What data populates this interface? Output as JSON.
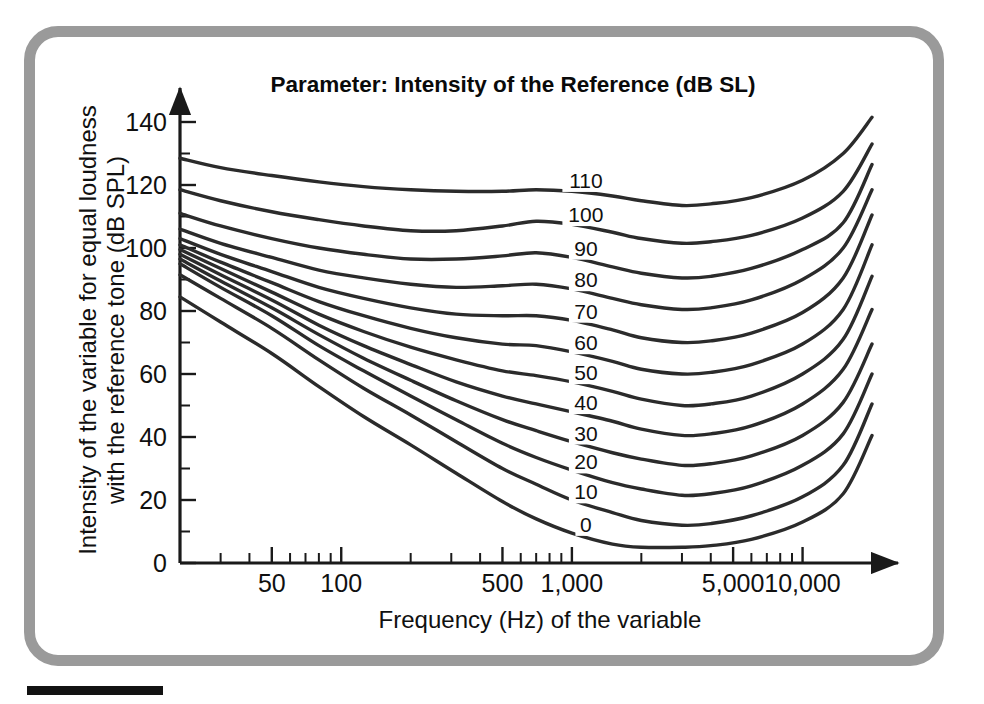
{
  "figure": {
    "frame_color": "#9a9a9a",
    "background": "#ffffff",
    "rule_color": "#121212"
  },
  "chart_data": {
    "type": "line",
    "title": "Parameter: Intensity of the Reference (dB SL)",
    "xlabel": "Frequency (Hz) of the variable",
    "ylabel_line1": "Intensity of the variable for equal loudness",
    "ylabel_line2": "with the reference tone (dB SPL)",
    "xscale": "log",
    "xlim": [
      20,
      20000
    ],
    "ylim": [
      0,
      148
    ],
    "grid": false,
    "legend": "inline-curve-labels",
    "xticks_major": [
      50,
      100,
      500,
      1000,
      5000,
      10000
    ],
    "xtick_labels": [
      "50",
      "100",
      "500",
      "1,000",
      "5,000",
      "10,000"
    ],
    "yticks_major": [
      0,
      20,
      40,
      60,
      80,
      100,
      120,
      140
    ],
    "ytick_labels": [
      "0",
      "20",
      "40",
      "60",
      "80",
      "100",
      "120",
      "140"
    ],
    "ytick_minor_step": 10,
    "x": [
      20,
      30,
      50,
      80,
      125,
      200,
      315,
      500,
      700,
      1000,
      1500,
      2000,
      3000,
      4000,
      6000,
      10000,
      15000,
      20000
    ],
    "series": [
      {
        "name": "110",
        "label": "110",
        "label_x": 1150,
        "values": [
          128.5,
          125.5,
          123.0,
          121.0,
          119.5,
          118.5,
          118.0,
          118.0,
          118.5,
          118.0,
          116.5,
          115.0,
          113.5,
          114.0,
          116.0,
          121.5,
          130.0,
          141.5
        ]
      },
      {
        "name": "100",
        "label": "100",
        "label_x": 1150,
        "values": [
          118.5,
          115.0,
          111.5,
          109.0,
          107.0,
          105.5,
          105.5,
          107.0,
          108.5,
          107.5,
          105.0,
          103.0,
          101.5,
          102.0,
          104.0,
          109.5,
          118.0,
          133.0
        ]
      },
      {
        "name": "90",
        "label": "90",
        "label_x": 1150,
        "values": [
          111.0,
          107.0,
          103.0,
          100.0,
          98.0,
          96.5,
          96.5,
          97.5,
          98.5,
          97.0,
          94.0,
          92.0,
          90.5,
          91.0,
          93.5,
          99.5,
          108.0,
          126.5
        ]
      },
      {
        "name": "80",
        "label": "80",
        "label_x": 1150,
        "values": [
          106.0,
          101.5,
          97.0,
          93.0,
          90.5,
          88.5,
          87.5,
          88.0,
          88.5,
          87.0,
          84.0,
          82.0,
          80.5,
          81.0,
          83.5,
          90.0,
          100.0,
          118.5
        ]
      },
      {
        "name": "70",
        "label": "70",
        "label_x": 1150,
        "values": [
          103.0,
          98.0,
          92.5,
          87.5,
          84.0,
          81.0,
          79.0,
          78.5,
          78.5,
          77.0,
          74.0,
          71.5,
          70.0,
          70.5,
          73.0,
          79.5,
          90.5,
          110.5
        ]
      },
      {
        "name": "60",
        "label": "60",
        "label_x": 1150,
        "values": [
          101.0,
          95.5,
          89.0,
          83.0,
          78.5,
          74.5,
          71.5,
          69.5,
          69.0,
          67.0,
          64.0,
          61.5,
          60.0,
          60.5,
          63.0,
          69.5,
          80.5,
          101.0
        ]
      },
      {
        "name": "50",
        "label": "50",
        "label_x": 1150,
        "values": [
          99.5,
          93.5,
          86.0,
          79.0,
          73.5,
          68.5,
          64.5,
          61.0,
          59.5,
          57.5,
          54.5,
          52.0,
          50.0,
          50.5,
          53.0,
          60.0,
          71.0,
          91.0
        ]
      },
      {
        "name": "40",
        "label": "40",
        "label_x": 1150,
        "values": [
          98.0,
          91.5,
          83.5,
          75.5,
          69.0,
          63.0,
          57.5,
          53.0,
          50.5,
          48.0,
          45.0,
          42.5,
          40.5,
          41.0,
          43.5,
          50.5,
          61.5,
          80.5
        ]
      },
      {
        "name": "30",
        "label": "30",
        "label_x": 1150,
        "values": [
          96.5,
          89.5,
          81.0,
          72.5,
          65.0,
          58.0,
          51.5,
          45.5,
          42.0,
          38.5,
          35.0,
          33.0,
          31.0,
          31.5,
          34.0,
          40.5,
          51.0,
          69.5
        ]
      },
      {
        "name": "20",
        "label": "20",
        "label_x": 1150,
        "values": [
          95.0,
          87.5,
          78.5,
          69.0,
          61.0,
          53.0,
          45.5,
          38.0,
          33.5,
          29.5,
          25.5,
          23.5,
          21.5,
          22.0,
          24.5,
          31.0,
          41.0,
          60.0
        ]
      },
      {
        "name": "10",
        "label": "10",
        "label_x": 1150,
        "values": [
          91.5,
          84.0,
          74.5,
          64.5,
          55.5,
          47.0,
          38.5,
          30.0,
          25.0,
          20.0,
          16.0,
          13.5,
          12.0,
          12.5,
          15.0,
          21.0,
          31.0,
          50.5
        ]
      },
      {
        "name": "0",
        "label": "0",
        "label_x": 1150,
        "values": [
          84.5,
          76.5,
          66.5,
          56.0,
          46.5,
          37.5,
          28.5,
          19.5,
          14.0,
          9.5,
          6.0,
          5.0,
          5.0,
          5.5,
          7.5,
          13.0,
          22.0,
          40.5
        ]
      }
    ]
  }
}
